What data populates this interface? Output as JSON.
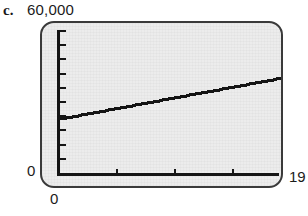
{
  "figure": {
    "part_label": "c.",
    "device": "graphing-calculator-screen"
  },
  "labels": {
    "y_max": "60,000",
    "y_min": "0",
    "x_min": "0",
    "x_max": "19"
  },
  "colors": {
    "ink": "#1b1b1b",
    "bezel": "#3a3a3a",
    "screen_bg": "#ececec",
    "trace": "#141414"
  },
  "chart_data": {
    "type": "line",
    "title": "",
    "subtitle": "",
    "xlabel": "",
    "ylabel": "",
    "xlim": [
      0,
      19
    ],
    "ylim": [
      0,
      60000
    ],
    "grid": false,
    "legend": null,
    "axis_ticks": {
      "x_tick_values": [
        5,
        10,
        15
      ],
      "y_tick_count": 10,
      "y_tick_values": [
        6000,
        12000,
        18000,
        24000,
        30000,
        36000,
        42000,
        48000,
        54000,
        60000
      ]
    },
    "annotations": [
      "c."
    ],
    "series": [
      {
        "name": "value",
        "x": [
          0,
          1,
          2,
          3,
          4,
          5,
          6,
          7,
          8,
          9,
          10,
          11,
          12,
          13,
          14,
          15,
          16,
          17,
          18,
          19
        ],
        "values": [
          23000,
          23900,
          24800,
          25700,
          26600,
          27500,
          28400,
          29300,
          30200,
          31100,
          32000,
          32900,
          33800,
          34700,
          35600,
          36500,
          37400,
          38300,
          39200,
          40100
        ]
      }
    ]
  }
}
